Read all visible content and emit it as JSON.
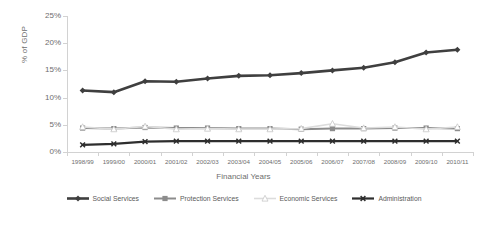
{
  "chart_data": {
    "type": "line",
    "title": "",
    "xlabel": "Financial Years",
    "ylabel": "% of GDP",
    "categories": [
      "1998/99",
      "1999/00",
      "2000/01",
      "2001/02",
      "2002/03",
      "2003/04",
      "2004/05",
      "2005/06",
      "2006/07",
      "2007/08",
      "2008/09",
      "2009/10",
      "2010/11"
    ],
    "ylim": [
      0,
      25
    ],
    "ytick_labels": [
      "0%",
      "5%",
      "10%",
      "15%",
      "20%",
      "25%"
    ],
    "ytick_values": [
      0,
      5,
      10,
      15,
      20,
      25
    ],
    "grid": false,
    "legend_position": "bottom",
    "series": [
      {
        "name": "Social Services",
        "color": "#3f3f3f",
        "marker": "diamond",
        "values": [
          11.3,
          11.0,
          13.0,
          12.9,
          13.5,
          14.0,
          14.1,
          14.5,
          15.0,
          15.5,
          16.5,
          18.3,
          18.8
        ]
      },
      {
        "name": "Protection Services",
        "color": "#8c8c8c",
        "marker": "square",
        "values": [
          4.4,
          4.3,
          4.5,
          4.4,
          4.4,
          4.3,
          4.3,
          4.2,
          4.3,
          4.3,
          4.4,
          4.4,
          4.3
        ]
      },
      {
        "name": "Economic Services",
        "color": "#dcdcdc",
        "marker": "triangle",
        "values": [
          4.6,
          4.2,
          4.7,
          4.2,
          4.3,
          4.2,
          4.2,
          4.3,
          5.2,
          4.4,
          4.6,
          4.2,
          4.6
        ]
      },
      {
        "name": "Administration",
        "color": "#2e2e2e",
        "marker": "cross",
        "values": [
          1.3,
          1.5,
          1.9,
          2.0,
          2.0,
          2.0,
          2.0,
          2.0,
          2.0,
          2.0,
          2.0,
          2.0,
          2.0
        ]
      }
    ]
  }
}
